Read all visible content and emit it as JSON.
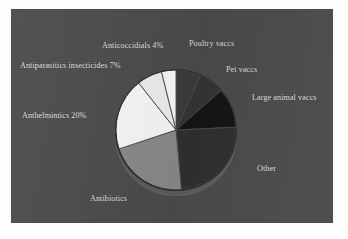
{
  "figure": {
    "background_color": "#4c4c4c",
    "page_color": "#fdfdfd",
    "label_color": "#e9e9e9"
  },
  "chart_data": {
    "type": "pie",
    "title": "",
    "subtitle": "",
    "xlabel": "",
    "ylabel": "",
    "legend_position": "none",
    "grid": false,
    "start_angle_deg": 0,
    "direction": "clockwise",
    "categories": [
      "Poultry vaccs",
      "Pet vaccs",
      "Large animal vaccs",
      "Other",
      "Antibiotics",
      "Anthelmintics",
      "Antiparasitics insecticides",
      "Anticoccidials"
    ],
    "values": [
      7,
      7,
      11,
      25,
      22,
      20,
      7,
      4
    ],
    "labels": [
      "Poultry vaccs",
      "Pet vaccs",
      "Large animal vaccs",
      "Other",
      "Antibiotics",
      "Anthelmintics 20%",
      "Antiparasitics insecticides 7%",
      "Anticoccidials 4%"
    ],
    "colors": [
      "#3c3c3c",
      "#353535",
      "#151515",
      "#303030",
      "#8a8a8a",
      "#f8f8f8",
      "#efefef",
      "#fafafa"
    ]
  },
  "labels": {
    "anticoccidials": "Anticoccidials 4%",
    "poultry_vaccs": "Poultry vaccs",
    "antiparasitics": "Antiparasitics insecticides 7%",
    "pet_vaccs": "Pet vaccs",
    "large_animal_vaccs": "Large animal vaccs",
    "anthelmintics": "Anthelmintics 20%",
    "other": "Other",
    "antibiotics": "Antibiotics"
  }
}
